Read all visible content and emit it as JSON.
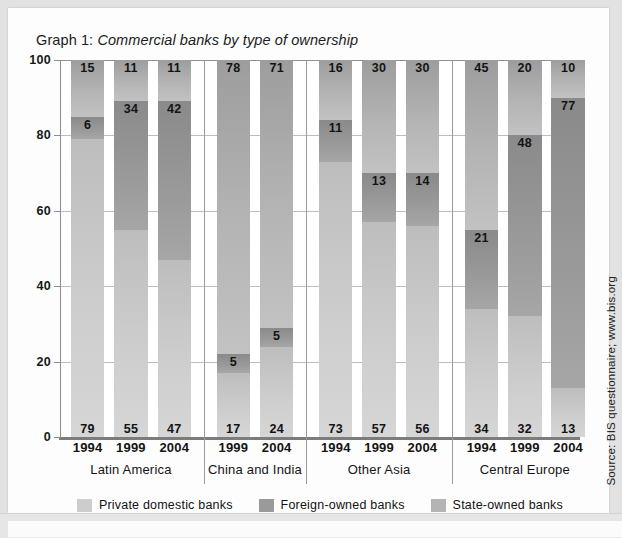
{
  "figure": {
    "title_prefix": "Graph 1:",
    "title_text": "Commercial banks by type of ownership",
    "source": "Source: BIS questionnaire; www.bis.org"
  },
  "colors": {
    "private_domestic": "#cdcdcd",
    "foreign_owned": "#9a9a9a",
    "state_owned": "#b4b4b4",
    "axis": "#8d8d8d",
    "grid": "#bdbdbd",
    "page_background": "#e2e2e2",
    "card_background": "#fdfdfd"
  },
  "legend": {
    "position": "bottom-center",
    "items": [
      {
        "label": "Private domestic banks",
        "key": "private_domestic"
      },
      {
        "label": "Foreign-owned banks",
        "key": "foreign_owned"
      },
      {
        "label": "State-owned banks",
        "key": "state_owned"
      }
    ]
  },
  "axis": {
    "y_ticks": [
      "0",
      "20",
      "40",
      "60",
      "80",
      "100"
    ],
    "y_min": 0,
    "y_max": 100,
    "grid": true
  },
  "groups": [
    {
      "name": "Latin America",
      "years": [
        "1994",
        "1999",
        "2004"
      ]
    },
    {
      "name": "China and India",
      "years": [
        "1999",
        "2004"
      ]
    },
    {
      "name": "Other Asia",
      "years": [
        "1994",
        "1999",
        "2004"
      ]
    },
    {
      "name": "Central Europe",
      "years": [
        "1994",
        "1999",
        "2004"
      ]
    }
  ],
  "chart_data": {
    "type": "bar",
    "subtype": "stacked-100",
    "title": "Graph 1: Commercial banks by type of ownership",
    "xlabel": "",
    "ylabel": "",
    "ylim": [
      0,
      100
    ],
    "yticks": [
      0,
      20,
      40,
      60,
      80,
      100
    ],
    "grid": true,
    "legend_position": "bottom-center",
    "categories": [
      "Latin America 1994",
      "Latin America 1999",
      "Latin America 2004",
      "China and India 1999",
      "China and India 2004",
      "Other Asia 1994",
      "Other Asia 1999",
      "Other Asia 2004",
      "Central Europe 1994",
      "Central Europe 1999",
      "Central Europe 2004"
    ],
    "series": [
      {
        "name": "Private domestic banks",
        "values": [
          79,
          55,
          47,
          17,
          24,
          73,
          57,
          56,
          34,
          32,
          13
        ]
      },
      {
        "name": "Foreign-owned banks",
        "values": [
          6,
          34,
          42,
          5,
          5,
          11,
          13,
          14,
          21,
          48,
          77
        ]
      },
      {
        "name": "State-owned banks",
        "values": [
          15,
          11,
          11,
          78,
          71,
          16,
          30,
          30,
          45,
          20,
          10
        ]
      }
    ],
    "source": "Source: BIS questionnaire; www.bis.org"
  },
  "bars": [
    {
      "group": "Latin America",
      "year": "1994",
      "private": "79",
      "foreign": "6",
      "state": "15"
    },
    {
      "group": "Latin America",
      "year": "1999",
      "private": "55",
      "foreign": "34",
      "state": "11"
    },
    {
      "group": "Latin America",
      "year": "2004",
      "private": "47",
      "foreign": "42",
      "state": "11"
    },
    {
      "group": "China and India",
      "year": "1999",
      "private": "17",
      "foreign": "5",
      "state": "78"
    },
    {
      "group": "China and India",
      "year": "2004",
      "private": "24",
      "foreign": "5",
      "state": "71"
    },
    {
      "group": "Other Asia",
      "year": "1994",
      "private": "73",
      "foreign": "11",
      "state": "16"
    },
    {
      "group": "Other Asia",
      "year": "1999",
      "private": "57",
      "foreign": "13",
      "state": "30"
    },
    {
      "group": "Other Asia",
      "year": "2004",
      "private": "56",
      "foreign": "14",
      "state": "30"
    },
    {
      "group": "Central Europe",
      "year": "1994",
      "private": "34",
      "foreign": "21",
      "state": "45"
    },
    {
      "group": "Central Europe",
      "year": "1999",
      "private": "32",
      "foreign": "48",
      "state": "20"
    },
    {
      "group": "Central Europe",
      "year": "2004",
      "private": "13",
      "foreign": "77",
      "state": "10"
    }
  ]
}
